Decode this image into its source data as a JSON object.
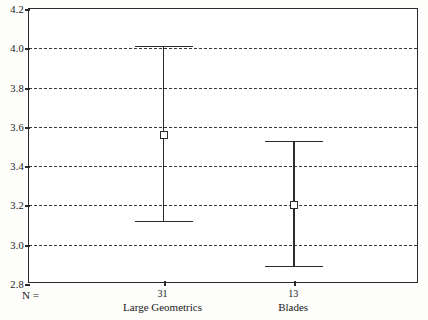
{
  "chart_data": {
    "type": "scatter",
    "title": "",
    "subtitle": "",
    "xlabel": "",
    "ylabel": "",
    "ylim": [
      2.8,
      4.2
    ],
    "ytick_labels": [
      "4.2",
      "4.0",
      "3.8",
      "3.6",
      "3.4",
      "3.2",
      "3.0",
      "2.8"
    ],
    "ytick_values": [
      4.2,
      4.0,
      3.8,
      3.6,
      3.4,
      3.2,
      3.0,
      2.8
    ],
    "grid": true,
    "legend": "none",
    "n_prefix": "N =",
    "categories": [
      "Large Geometrics",
      "Blades"
    ],
    "counts": [
      31,
      13
    ],
    "count_labels": [
      "31",
      "13"
    ],
    "series": [
      {
        "name": "mean",
        "values": [
          3.56,
          3.2
        ]
      },
      {
        "name": "ci_upper",
        "values": [
          4.01,
          3.53
        ]
      },
      {
        "name": "ci_lower",
        "values": [
          3.12,
          2.89
        ]
      }
    ],
    "points": [
      {
        "category": "Large Geometrics",
        "n": "31",
        "mean": 3.56,
        "upper": 4.01,
        "lower": 3.12
      },
      {
        "category": "Blades",
        "n": "13",
        "mean": 3.2,
        "upper": 3.53,
        "lower": 2.89
      }
    ],
    "colors": {
      "axis": "#2b2b2b",
      "grid": "#3a3a3a",
      "marker_fill": "#ffffff",
      "marker_edge": "#2b2b2b",
      "background": "#ffffff"
    }
  }
}
